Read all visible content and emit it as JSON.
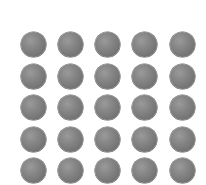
{
  "grid": {
    "rows": 5,
    "cols": 5,
    "item": "sphere",
    "color": "#7e7e7e",
    "col_centers": [
      33,
      70,
      107,
      144,
      182
    ],
    "row_centers": [
      44,
      76,
      107,
      139,
      170
    ],
    "diameter": 25
  }
}
